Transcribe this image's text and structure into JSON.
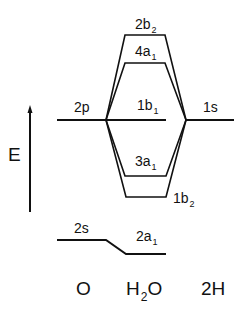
{
  "diagram": {
    "type": "molecular-orbital-diagram",
    "axis": {
      "label": "E",
      "direction": "up"
    },
    "columns": [
      {
        "id": "O",
        "label_main": "O",
        "label_sub": ""
      },
      {
        "id": "H2O",
        "label_main": "H",
        "label_sub": "2",
        "label_tail": "O"
      },
      {
        "id": "2H",
        "label_main": "2H",
        "label_sub": ""
      }
    ],
    "atomic_orbitals": {
      "O": [
        {
          "name": "2p",
          "main": "2p",
          "sub": ""
        },
        {
          "name": "2s",
          "main": "2s",
          "sub": ""
        }
      ],
      "2H": [
        {
          "name": "1s",
          "main": "1s",
          "sub": ""
        }
      ]
    },
    "molecular_orbitals": [
      {
        "name": "2b2",
        "main": "2b",
        "sub": "2",
        "order": 1
      },
      {
        "name": "4a1",
        "main": "4a",
        "sub": "1",
        "order": 2
      },
      {
        "name": "1b1",
        "main": "1b",
        "sub": "1",
        "order": 3
      },
      {
        "name": "3a1",
        "main": "3a",
        "sub": "1",
        "order": 4
      },
      {
        "name": "1b2",
        "main": "1b",
        "sub": "2",
        "order": 5
      },
      {
        "name": "2a1",
        "main": "2a",
        "sub": "1",
        "order": 6
      }
    ],
    "line_color": "#111111"
  }
}
